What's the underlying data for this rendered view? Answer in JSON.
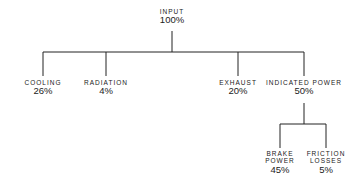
{
  "diagram": {
    "root": {
      "label": "INPUT",
      "value": "100%"
    },
    "level1": [
      {
        "label": "COOLING",
        "value": "26%"
      },
      {
        "label": "RADIATION",
        "value": "4%"
      },
      {
        "label": "EXHAUST",
        "value": "20%"
      },
      {
        "label": "INDICATED POWER",
        "value": "50%"
      }
    ],
    "level2": [
      {
        "label_line1": "BRAKE",
        "label_line2": "POWER",
        "value": "45%"
      },
      {
        "label_line1": "FRICTION",
        "label_line2": "LOSSES",
        "value": "5%"
      }
    ],
    "line_color": "#222222"
  }
}
